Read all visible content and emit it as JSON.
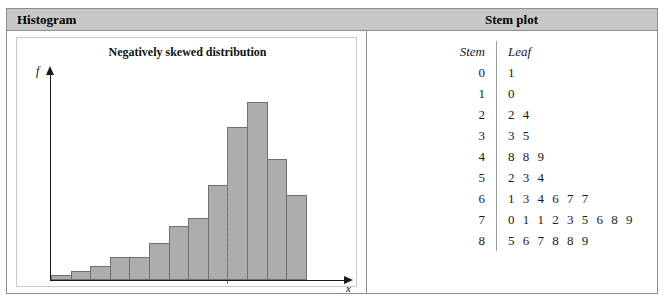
{
  "panels": {
    "histogram_header": "Histogram",
    "stemplot_header": "Stem plot"
  },
  "histogram": {
    "title": "Negatively skewed distribution",
    "y_axis_label": "f",
    "x_axis_label": "x",
    "bar_fill_color": "#adadad",
    "bar_border_color": "#6f6f6f",
    "mean_line_color": "#7d7d7d"
  },
  "chart_data": {
    "type": "bar",
    "title": "Negatively skewed distribution",
    "xlabel": "x",
    "ylabel": "f",
    "grid": false,
    "legend": "none",
    "categories": [
      "1",
      "2",
      "3",
      "4",
      "5",
      "6",
      "7",
      "8",
      "9",
      "10",
      "11",
      "12",
      "13"
    ],
    "values": [
      4,
      7,
      11,
      19,
      19,
      30,
      44,
      50,
      77,
      124,
      144,
      98,
      69
    ],
    "ylim": [
      0,
      160
    ],
    "annotations": [
      {
        "type": "vertical-dashed-line",
        "label": "mean/median marker",
        "at_category_boundary": 9
      }
    ]
  },
  "stem_plot": {
    "headers": {
      "stem": "Stem",
      "leaf": "Leaf"
    },
    "rows": [
      {
        "stem": "0",
        "leaf": "1"
      },
      {
        "stem": "1",
        "leaf": "0"
      },
      {
        "stem": "2",
        "leaf": "2 4"
      },
      {
        "stem": "3",
        "leaf": "3 5"
      },
      {
        "stem": "4",
        "leaf": "8 8 9"
      },
      {
        "stem": "5",
        "leaf": "2 3 4"
      },
      {
        "stem": "6",
        "leaf": "1 3 4 6 7 7"
      },
      {
        "stem": "7",
        "leaf": "0 1 1 2 3 5 6 8 9"
      },
      {
        "stem": "8",
        "leaf": "5 6 7 8 8 9"
      }
    ]
  }
}
